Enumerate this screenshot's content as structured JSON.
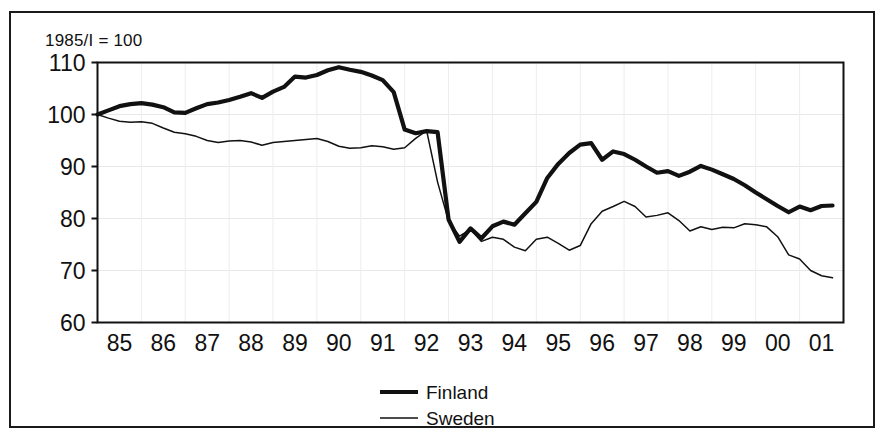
{
  "caption": "1985/I = 100",
  "legend": {
    "position": "bottom-center",
    "entries": [
      {
        "label": "Finland",
        "style": "thick"
      },
      {
        "label": "Sweden",
        "style": "thin"
      }
    ]
  },
  "chart_data": {
    "type": "line",
    "title": "1985/I = 100",
    "xlabel": "",
    "ylabel": "",
    "xlim": [
      1985.0,
      2002.0
    ],
    "ylim": [
      60,
      110
    ],
    "grid": true,
    "yticks": [
      110,
      100,
      90,
      80,
      70,
      60
    ],
    "ytick_labels": [
      "110",
      "100",
      "90",
      "80",
      "70",
      "60"
    ],
    "xticks": [
      1985,
      1986,
      1987,
      1988,
      1989,
      1990,
      1991,
      1992,
      1993,
      1994,
      1995,
      1996,
      1997,
      1998,
      1999,
      2000,
      2001
    ],
    "xtick_labels": [
      "85",
      "86",
      "87",
      "88",
      "89",
      "90",
      "91",
      "92",
      "93",
      "94",
      "95",
      "96",
      "97",
      "98",
      "99",
      "00",
      "01"
    ],
    "x": [
      1985.0,
      1985.25,
      1985.5,
      1985.75,
      1986.0,
      1986.25,
      1986.5,
      1986.75,
      1987.0,
      1987.25,
      1987.5,
      1987.75,
      1988.0,
      1988.25,
      1988.5,
      1988.75,
      1989.0,
      1989.25,
      1989.5,
      1989.75,
      1990.0,
      1990.25,
      1990.5,
      1990.75,
      1991.0,
      1991.25,
      1991.5,
      1991.75,
      1992.0,
      1992.25,
      1992.5,
      1992.75,
      1993.0,
      1993.25,
      1993.5,
      1993.75,
      1994.0,
      1994.25,
      1994.5,
      1994.75,
      1995.0,
      1995.25,
      1995.5,
      1995.75,
      1996.0,
      1996.25,
      1996.5,
      1996.75,
      1997.0,
      1997.25,
      1997.5,
      1997.75,
      1998.0,
      1998.25,
      1998.5,
      1998.75,
      1999.0,
      1999.25,
      1999.5,
      1999.75,
      2000.0,
      2000.25,
      2000.5,
      2000.75,
      2001.0,
      2001.25,
      2001.5,
      2001.75
    ],
    "series": [
      {
        "name": "Finland",
        "style": "thick",
        "color": "#111111",
        "values": [
          100.0,
          100.8,
          101.6,
          102.0,
          102.2,
          101.9,
          101.4,
          100.4,
          100.3,
          101.2,
          102.0,
          102.3,
          102.8,
          103.4,
          104.1,
          103.2,
          104.4,
          105.3,
          107.3,
          107.1,
          107.6,
          108.5,
          109.1,
          108.6,
          108.2,
          107.5,
          106.6,
          104.3,
          97.1,
          96.4,
          96.8,
          96.6,
          79.8,
          75.5,
          78.1,
          76.2,
          78.5,
          79.4,
          78.8,
          81.0,
          83.2,
          87.8,
          90.5,
          92.6,
          94.2,
          94.5,
          91.3,
          92.9,
          92.4,
          91.3,
          90.0,
          88.8,
          89.1,
          88.2,
          89.0,
          90.1,
          89.4,
          88.5,
          87.6,
          86.4,
          85.0,
          83.7,
          82.4,
          81.2,
          82.3,
          81.6,
          82.4,
          82.5
        ]
      },
      {
        "name": "Sweden",
        "style": "thin",
        "color": "#111111",
        "values": [
          100.0,
          99.3,
          98.7,
          98.5,
          98.6,
          98.3,
          97.4,
          96.6,
          96.3,
          95.8,
          95.0,
          94.6,
          94.9,
          95.0,
          94.7,
          94.1,
          94.6,
          94.8,
          95.0,
          95.2,
          95.4,
          94.8,
          93.9,
          93.5,
          93.6,
          94.0,
          93.8,
          93.3,
          93.6,
          95.4,
          96.9,
          87.0,
          79.5,
          76.6,
          77.9,
          75.6,
          76.4,
          76.0,
          74.5,
          73.8,
          76.0,
          76.4,
          75.2,
          73.9,
          74.8,
          79.0,
          81.4,
          82.3,
          83.3,
          82.3,
          80.3,
          80.6,
          81.1,
          79.6,
          77.6,
          78.4,
          77.9,
          78.3,
          78.2,
          79.0,
          78.8,
          78.4,
          76.5,
          73.0,
          72.2,
          70.0,
          69.0,
          68.6
        ]
      }
    ]
  }
}
